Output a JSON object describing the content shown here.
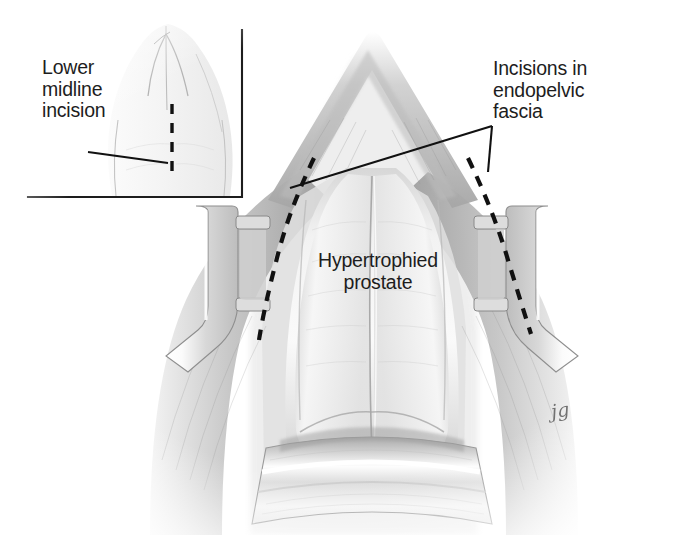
{
  "figure": {
    "domain": "medical-illustration",
    "width": 688,
    "height": 535,
    "background_color": "#ffffff",
    "ink_color": "#1d1d1d",
    "media": "graphite pencil rendering, grayscale"
  },
  "labels": {
    "lower_midline_incision": {
      "lines": [
        "Lower",
        "midline",
        "incision"
      ],
      "text": "Lower\nmidline\nincision",
      "x": 42,
      "y": 57,
      "leader": "single straight line from label to dashed midline incision"
    },
    "incisions_endopelvic_fascia": {
      "lines": [
        "Incisions in",
        "endopelvic",
        "fascia"
      ],
      "text": "Incisions in\nendopelvic\nfascia",
      "x": 493,
      "y": 58,
      "leader": "V-shaped double leader pointing to left and right dashed incision lines"
    },
    "hypertrophied_prostate": {
      "lines": [
        "Hypertrophied",
        "prostate"
      ],
      "text": "Hypertrophied\nprostate",
      "x": 318,
      "y": 250,
      "leader": "none"
    }
  },
  "signature": {
    "text": "jg",
    "x": 551,
    "y": 399
  },
  "inset": {
    "name": "lower midline incision inset",
    "border_color": "#1d1d1d",
    "border_x": 242,
    "border_y": 197,
    "border_top": 30,
    "border_left": 28,
    "content": "lower abdomen / torso viewed from front with vertical dashed midline incision line"
  },
  "annotation_lines": {
    "inset_leader": {
      "x1": 88,
      "y1": 152,
      "x2": 168,
      "y2": 163
    },
    "fascia_leader_left": {
      "x1": 492,
      "y1": 126,
      "x2": 290,
      "y2": 188
    },
    "fascia_leader_right": {
      "x1": 492,
      "y1": 126,
      "x2": 488,
      "y2": 172
    }
  },
  "dashed_incisions": {
    "midline_inset": {
      "description": "vertical dashed line on abdomen in inset",
      "x": 172,
      "y_start": 104,
      "y_end": 180
    },
    "endopelvic_left": {
      "description": "curved dashed incision in left endopelvic fascia",
      "start": [
        314,
        158
      ],
      "end": [
        259,
        340
      ]
    },
    "endopelvic_right": {
      "description": "curved dashed incision in right endopelvic fascia",
      "start": [
        468,
        158
      ],
      "end": [
        531,
        334
      ]
    }
  },
  "anatomy": {
    "parts": [
      {
        "name": "hypertrophied-prostate",
        "note": "large bilobed gland occupying center of field with median sulcus"
      },
      {
        "name": "endopelvic-fascia",
        "note": "glistening fascia sheets lateral to prostate, site of incisions"
      },
      {
        "name": "levator-ani-muscle",
        "note": "muscular pelvic side walls flanking prostate"
      },
      {
        "name": "puboprostatic-region",
        "note": "apex of field at top, inverted-V of retracted tissue"
      },
      {
        "name": "bladder-neck",
        "note": "lower region beneath prostate behind retractor blade"
      }
    ]
  },
  "instruments": {
    "retractors": [
      {
        "name": "left-retractor-blade",
        "position": "left of prostate",
        "note": "self-retaining blade with two encircling bands"
      },
      {
        "name": "right-retractor-blade",
        "position": "right of prostate",
        "note": "mirror image blade with two encircling bands"
      },
      {
        "name": "inferior-retractor-blade",
        "position": "bottom center",
        "note": "wide malleable blade retracting bladder inferiorly"
      }
    ]
  },
  "colors": {
    "ink": "#1d1d1d",
    "paper": "#ffffff",
    "tissue_mid": "#c9c9c9",
    "tissue_dark": "#8d8d8d",
    "tissue_light": "#ededed",
    "metal": "#e6e6e6"
  }
}
